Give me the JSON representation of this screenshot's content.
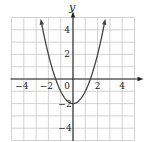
{
  "chart_data": {
    "type": "line",
    "title": "",
    "function": "y = x^2 - 2",
    "xlabel": "x",
    "ylabel": "y",
    "xlim": [
      -5,
      5
    ],
    "ylim": [
      -5,
      5
    ],
    "grid": true,
    "grid_step": 1,
    "x_ticks": [
      -4,
      -2,
      0,
      2,
      4
    ],
    "x_tick_labels": [
      "−4",
      "−2",
      "0",
      "2",
      "4"
    ],
    "y_ticks": [
      4,
      2,
      -2,
      -4
    ],
    "y_tick_labels": [
      "4",
      "2",
      "−2",
      "−4"
    ],
    "series": [
      {
        "name": "y = x^2 - 2",
        "x": [
          -2.65,
          -2.5,
          -2,
          -1.5,
          -1,
          -0.5,
          0,
          0.5,
          1,
          1.5,
          2,
          2.5,
          2.65
        ],
        "y": [
          5.02,
          4.25,
          2,
          0.25,
          -1,
          -1.75,
          -2,
          -1.75,
          -1,
          0.25,
          2,
          4.25,
          5.02
        ]
      }
    ],
    "vertex": [
      0,
      -2
    ],
    "x_intercepts": [
      -1.414,
      1.414
    ],
    "y_intercept": -2,
    "arrows_at_ends": true,
    "legend": null
  },
  "labels": {
    "x_axis": "x",
    "y_axis": "y",
    "origin": "0",
    "xt_m4": "−4",
    "xt_m2": "−2",
    "xt_2": "2",
    "xt_4": "4",
    "yt_4": "4",
    "yt_2": "2",
    "yt_m2": "−2",
    "yt_m4": "−4"
  },
  "colors": {
    "grid": "#c8c8c8",
    "axis": "#222222",
    "curve": "#444444",
    "text": "#222222",
    "background": "#ffffff"
  }
}
